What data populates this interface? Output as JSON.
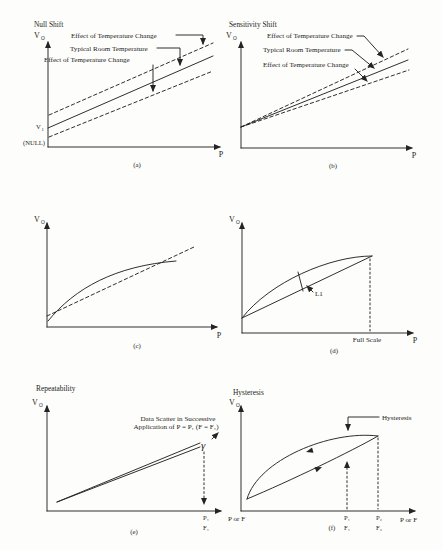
{
  "figure": {
    "background": "#fdfdfb",
    "ink": "#242424"
  },
  "panels": {
    "a": {
      "title": "Null Shift",
      "caption": "(a)",
      "y_label": "V",
      "y_label_sub": "O",
      "x_label": "P",
      "v1": "V",
      "v1_sub": "1",
      "null_label": "(NULL)",
      "annotations": [
        "Effect of Temperature Change",
        "Typical Room Temperature",
        "Effect of Temperature Change"
      ]
    },
    "b": {
      "title": "Sensitivity Shift",
      "caption": "(b)",
      "y_label": "V",
      "y_label_sub": "O",
      "x_label": "P",
      "annotations": [
        "Effect of Temperature Change",
        "Typical Room Temperature",
        "Effect of Temperature Change"
      ]
    },
    "c": {
      "caption": "(c)",
      "y_label": "V",
      "y_label_sub": "O",
      "x_label": "P"
    },
    "d": {
      "caption": "(d)",
      "y_label": "V",
      "y_label_sub": "O",
      "x_label": "P",
      "l1_label": "L1",
      "full_scale_label": "Full Scale"
    },
    "e": {
      "title": "Repeatability",
      "caption": "(e)",
      "y_label": "V",
      "y_label_sub": "O",
      "x_label": "P or F",
      "annotation_line1": "Data Scatter in Successive",
      "annotation_line2": "Application of P = P₁ (F = F₁)",
      "brace": "γ",
      "tick_p": "P₁",
      "tick_f": "F₁"
    },
    "f": {
      "title": "Hysteresis",
      "caption": "(f)",
      "y_label": "V",
      "y_label_sub": "O",
      "x_label": "P or F",
      "annotation": "Hysteresis",
      "tick1_p": "P₁",
      "tick1_f": "F₁",
      "tick2_p": "P₂",
      "tick2_f": "F₂"
    }
  }
}
